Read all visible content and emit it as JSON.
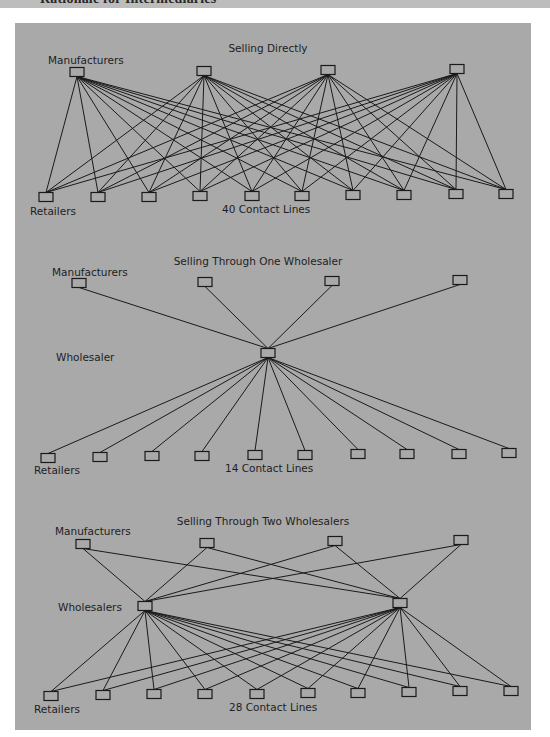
{
  "header": {
    "title": "Rationale for Intermediaries"
  },
  "colors": {
    "panel": "#a9a9a9",
    "line": "#1a1a1a",
    "header_strip": "#bdbdbd"
  },
  "diagrams": [
    {
      "title": "Selling Directly",
      "manufacturers_label": "Manufacturers",
      "retailers_label": "Retailers",
      "caption": "40 Contact Lines",
      "contact_lines": 40,
      "manufacturers": [
        [
          77,
          72
        ],
        [
          204,
          71
        ],
        [
          328,
          70
        ],
        [
          457,
          69
        ]
      ],
      "wholesalers": [],
      "retailers": [
        [
          46,
          197
        ],
        [
          98,
          197
        ],
        [
          149,
          197
        ],
        [
          200,
          196
        ],
        [
          252,
          196
        ],
        [
          302,
          196
        ],
        [
          353,
          195
        ],
        [
          404,
          195
        ],
        [
          456,
          194
        ],
        [
          506,
          194
        ]
      ]
    },
    {
      "title": "Selling Through One Wholesaler",
      "manufacturers_label": "Manufacturers",
      "wholesalers_label": "Wholesaler",
      "retailers_label": "Retailers",
      "caption": "14 Contact Lines",
      "contact_lines": 14,
      "manufacturers": [
        [
          79,
          283
        ],
        [
          205,
          282
        ],
        [
          332,
          281
        ],
        [
          460,
          280
        ]
      ],
      "wholesalers": [
        [
          268,
          353
        ]
      ],
      "retailers": [
        [
          48,
          458
        ],
        [
          100,
          457
        ],
        [
          152,
          456
        ],
        [
          202,
          456
        ],
        [
          255,
          455
        ],
        [
          305,
          455
        ],
        [
          358,
          454
        ],
        [
          407,
          454
        ],
        [
          459,
          454
        ],
        [
          509,
          453
        ]
      ]
    },
    {
      "title": "Selling Through Two Wholesalers",
      "manufacturers_label": "Manufacturers",
      "wholesalers_label": "Wholesalers",
      "retailers_label": "Retailers",
      "caption": "28 Contact Lines",
      "contact_lines": 28,
      "manufacturers": [
        [
          83,
          544
        ],
        [
          207,
          543
        ],
        [
          335,
          541
        ],
        [
          461,
          540
        ]
      ],
      "wholesalers": [
        [
          145,
          606
        ],
        [
          400,
          603
        ]
      ],
      "retailers": [
        [
          51,
          696
        ],
        [
          103,
          695
        ],
        [
          154,
          694
        ],
        [
          205,
          694
        ],
        [
          257,
          694
        ],
        [
          308,
          693
        ],
        [
          358,
          693
        ],
        [
          409,
          692
        ],
        [
          460,
          691
        ],
        [
          511,
          691
        ]
      ]
    }
  ]
}
